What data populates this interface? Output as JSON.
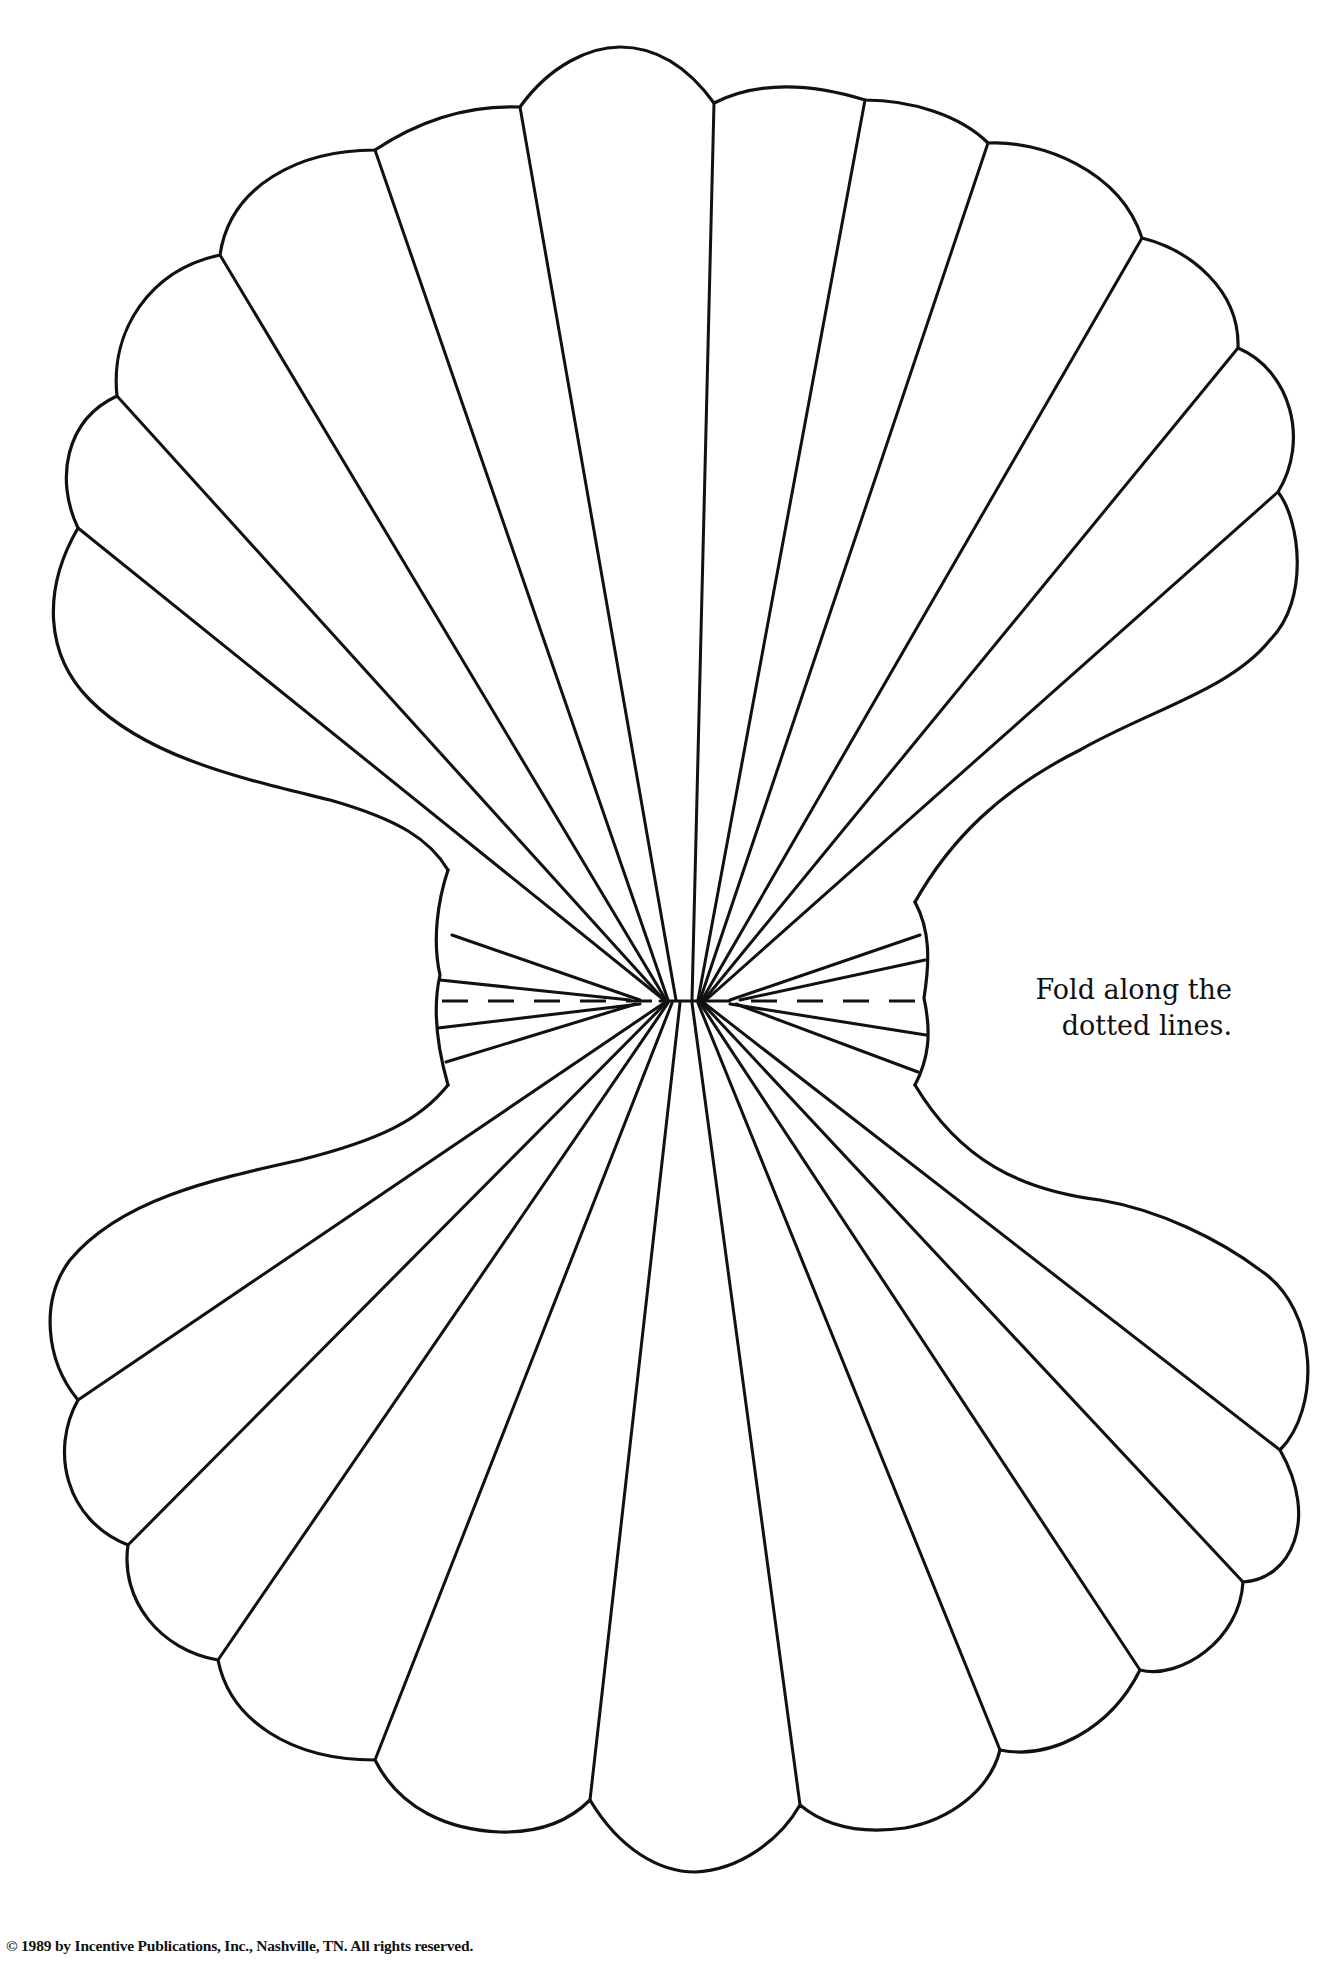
{
  "document": {
    "type": "craft template",
    "figure": "scallop shell fold pattern"
  },
  "instruction": {
    "line1": "Fold along the",
    "line2": "dotted lines."
  },
  "footer": {
    "copyright": "© 1989 by Incentive Publications, Inc., Nashville, TN. All rights reserved."
  },
  "colors": {
    "ink": "#111111",
    "paper": "#ffffff"
  }
}
